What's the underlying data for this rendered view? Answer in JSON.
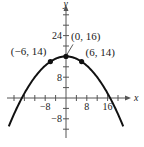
{
  "chart_data": {
    "type": "line",
    "title": "",
    "xlabel": "x",
    "ylabel": "y",
    "xlim": [
      -25,
      24
    ],
    "ylim": [
      -15,
      36
    ],
    "x_tick_step": 4,
    "y_tick_step": 4,
    "x_tick_labels": [
      {
        "value": -8,
        "text": "−8"
      },
      {
        "value": 8,
        "text": "8"
      },
      {
        "value": 16,
        "text": "16"
      }
    ],
    "y_tick_labels": [
      {
        "value": 24,
        "text": "24"
      },
      {
        "value": 8,
        "text": "8"
      },
      {
        "value": -8,
        "text": "−8"
      }
    ],
    "grid": false,
    "series": [
      {
        "name": "parabola",
        "equation": "y = 16 - x^2/18",
        "x_range": [
          -22,
          22
        ],
        "color": "#111111"
      }
    ],
    "points": [
      {
        "x": -6,
        "y": 14,
        "label": "(−6, 14)"
      },
      {
        "x": 0,
        "y": 16,
        "label": "(0, 16)"
      },
      {
        "x": 6,
        "y": 14,
        "label": "(6, 14)"
      }
    ]
  }
}
